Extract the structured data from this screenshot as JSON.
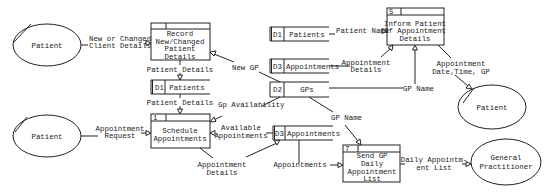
{
  "diagram": {
    "type": "data-flow-diagram",
    "external_entities": [
      {
        "id": "patient-1",
        "label": "Patient"
      },
      {
        "id": "patient-2",
        "label": "Patient"
      },
      {
        "id": "patient-3",
        "label": "Patient"
      },
      {
        "id": "gp",
        "label_lines": [
          "General",
          "Practitioner"
        ]
      }
    ],
    "processes": [
      {
        "id": "record",
        "number": "",
        "label_lines": [
          "Record",
          "New/Changed",
          "Patient",
          "Details"
        ]
      },
      {
        "id": "schedule",
        "number": "1",
        "label_lines": [
          "Schedule",
          "Appointments"
        ]
      },
      {
        "id": "inform",
        "number": "5",
        "label_lines": [
          "Inform Patient",
          "Of Appointment",
          "Details"
        ]
      },
      {
        "id": "send",
        "number": "7",
        "label_lines": [
          "Send GP",
          "Daily",
          "Appointment",
          "List"
        ]
      }
    ],
    "data_stores": [
      {
        "id": "d1-a",
        "code": "D1",
        "label": "Patients"
      },
      {
        "id": "d1-b",
        "code": "D1",
        "label": "Patients"
      },
      {
        "id": "d3-a",
        "code": "D3",
        "label": "Appointments"
      },
      {
        "id": "d2",
        "code": "D2",
        "label": "GPs"
      },
      {
        "id": "d3-b",
        "code": "D3",
        "label": "Appointments"
      }
    ],
    "flows": [
      {
        "id": "f1",
        "label_lines": [
          "New or Changed",
          "Client Details"
        ]
      },
      {
        "id": "f2",
        "label_lines": [
          "Patient Details"
        ]
      },
      {
        "id": "f3",
        "label_lines": [
          "New GP"
        ]
      },
      {
        "id": "f4",
        "label_lines": [
          "Patient Details"
        ]
      },
      {
        "id": "f5",
        "label_lines": [
          "Gp Availability"
        ]
      },
      {
        "id": "f6",
        "label_lines": [
          "Appointment",
          "Request"
        ]
      },
      {
        "id": "f7",
        "label_lines": [
          "Available",
          "Appointments"
        ]
      },
      {
        "id": "f8",
        "label_lines": [
          "Appointment",
          "Details"
        ]
      },
      {
        "id": "f9",
        "label_lines": [
          "Patient Name"
        ]
      },
      {
        "id": "f10",
        "label_lines": [
          "Appointment",
          "Details"
        ]
      },
      {
        "id": "f11",
        "label_lines": [
          "GP Name"
        ]
      },
      {
        "id": "f12",
        "label_lines": [
          "Appointment",
          "Date,Time, GP"
        ]
      },
      {
        "id": "f13",
        "label_lines": [
          "GP Name"
        ]
      },
      {
        "id": "f14",
        "label_lines": [
          "Appointments"
        ]
      },
      {
        "id": "f15",
        "label_lines": [
          "Daily Appointm-",
          "ent List"
        ]
      }
    ]
  }
}
